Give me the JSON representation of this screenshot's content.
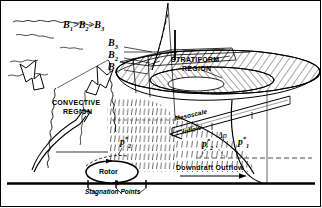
{
  "figure": {
    "background_color": "#ffffff",
    "line_color": "#000000"
  },
  "labels": {
    "buoyancy_inequality": {
      "b": "B",
      "i1": "1",
      "i2": "2",
      "i3": "3",
      "gt": ">"
    },
    "b3": {
      "base": "B",
      "sub": "3"
    },
    "b2": {
      "base": "B",
      "sub": "2"
    },
    "b1": {
      "base": "B",
      "sub": "1"
    },
    "stratiform_region_line1": "STRATIFORM",
    "stratiform_region_line2": "REGION",
    "convective_region_line1": "CONVECTIVE",
    "convective_region_line2": "REGION",
    "mesoscale": "Mesoscale",
    "inflow": "Inflow",
    "downdraft_outflow": "Downdraft Outflow",
    "rotor": "Rotor",
    "stagnation_points": "Stagnation Points",
    "p_star_2_left": {
      "base": "p",
      "sup": "*",
      "sub": "2"
    },
    "p_star_2_mid": {
      "base": "p",
      "sup": "*",
      "sub": "2"
    },
    "p_star_1": {
      "base": "p",
      "sup": "*",
      "sub": "1"
    },
    "delta_p": "Δp"
  },
  "icons": {
    "updraft_arrow_left": "curved-arrow-up-left-icon",
    "updraft_arrow_right": "curved-arrow-up-right-icon",
    "convective_updraft_arrow": "curved-arrow-up-icon",
    "inflow_arrow": "arrow-left-icon",
    "outflow_arrow": "arrow-right-icon",
    "rotor_circulation_arrow": "circulation-ellipse-icon",
    "stagnation_tick_left": "tick-mark-icon",
    "stagnation_tick_mid": "tick-mark-icon",
    "stagnation_tick_right": "tick-mark-icon"
  }
}
